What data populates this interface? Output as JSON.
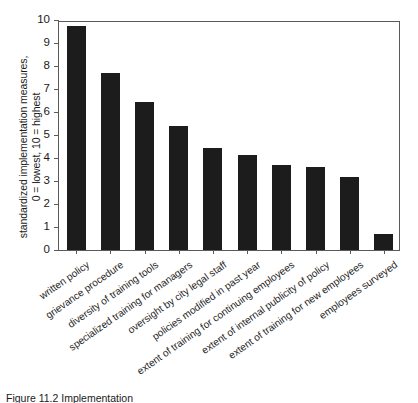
{
  "chart_data": {
    "type": "bar",
    "title": "",
    "xlabel": "",
    "ylabel": "standardized implementation measures,",
    "ylabel_line2": "0 = lowest, 10 = highest",
    "ylim": [
      0,
      10
    ],
    "yticks": [
      0,
      1,
      2,
      3,
      4,
      5,
      6,
      7,
      8,
      9,
      10
    ],
    "grid": false,
    "legend": "none",
    "bar_color": "#1c1c1c",
    "axis_color": "#5a5a5a",
    "categories": [
      "written policy",
      "grievance procedure",
      "diversity of training tools",
      "specialized training for managers",
      "oversight by city legal staff",
      "policies modified in past year",
      "extent of training for continuing employees",
      "extent of internal publicity of policy",
      "extent of training for new employees",
      "employees surveyed"
    ],
    "values": [
      9.75,
      7.7,
      6.45,
      5.4,
      4.45,
      4.15,
      3.7,
      3.6,
      3.18,
      0.7
    ]
  },
  "caption": {
    "text": "Figure 11.2  Implementation",
    "visible": "partially clipped"
  }
}
